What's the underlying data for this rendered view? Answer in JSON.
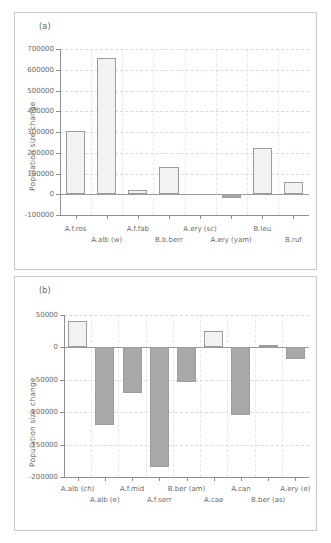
{
  "figure": {
    "panels": [
      {
        "id": "a",
        "label": "(a)",
        "ylabel": "Population size change"
      },
      {
        "id": "b",
        "label": "(b)",
        "ylabel": "Population size change"
      }
    ]
  },
  "chart_data": [
    {
      "type": "bar",
      "panel": "(a)",
      "title": "",
      "xlabel": "",
      "ylabel": "Population size change",
      "categories": [
        "A.f.ros",
        "A.alb (w)",
        "A.f.fab",
        "B.b.berr",
        "A.ery (sc)",
        "A.ery (yam)",
        "B.leu",
        "B.ruf"
      ],
      "values": [
        303000,
        657000,
        21000,
        131000,
        0,
        -18000,
        221000,
        57000
      ],
      "ylim": [
        -100000,
        700000
      ],
      "yticks": [
        -100000,
        0,
        100000,
        200000,
        300000,
        400000,
        500000,
        600000,
        700000
      ],
      "ytick_labels": [
        "-100000",
        "0",
        "100000",
        "200000",
        "300000",
        "400000",
        "500000",
        "600000",
        "700000"
      ],
      "grid": true,
      "legend": "none",
      "bar_fill_positive": "#f2f2f2",
      "bar_fill_negative": "#a8a8a8",
      "bar_edge": "#9c9c9c"
    },
    {
      "type": "bar",
      "panel": "(b)",
      "title": "",
      "xlabel": "",
      "ylabel": "Population size change",
      "categories": [
        "A.alb (ch)",
        "A.alb (e)",
        "A.f.mid",
        "A.f.serr",
        "B.ber (am)",
        "A.cae",
        "A.can",
        "B.ber (as)",
        "A.ery (e)"
      ],
      "values": [
        41000,
        -120000,
        -70000,
        -185000,
        -54000,
        26000,
        -104000,
        3000,
        -18000
      ],
      "ylim": [
        -200000,
        50000
      ],
      "yticks": [
        -200000,
        -150000,
        -100000,
        -50000,
        0,
        50000
      ],
      "ytick_labels": [
        "-200000",
        "-150000",
        "-100000",
        "-50000",
        "0",
        "50000"
      ],
      "grid": true,
      "legend": "none",
      "bar_fill_positive": "#f2f2f2",
      "bar_fill_negative": "#a8a8a8",
      "bar_edge": "#9c9c9c"
    }
  ]
}
